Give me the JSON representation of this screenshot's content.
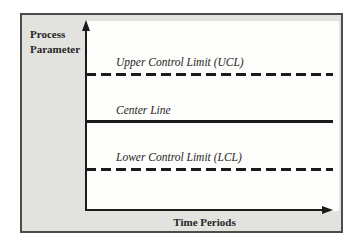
{
  "diagram": {
    "type": "control-chart-schematic",
    "y_axis_label": "Process Parameter",
    "x_axis_label": "Time Periods",
    "lines": [
      {
        "name": "upper-control-limit",
        "label": "Upper Control Limit (UCL)",
        "style": "dashed"
      },
      {
        "name": "center-line",
        "label": "Center Line",
        "style": "solid"
      },
      {
        "name": "lower-control-limit",
        "label": "Lower Control Limit (LCL)",
        "style": "dashed"
      }
    ],
    "colors": {
      "frame_background": "#e2e2df",
      "plot_background": "#fdfdfb",
      "line": "#1b1b1b",
      "border": "#4c4c48",
      "text": "#262626"
    }
  }
}
